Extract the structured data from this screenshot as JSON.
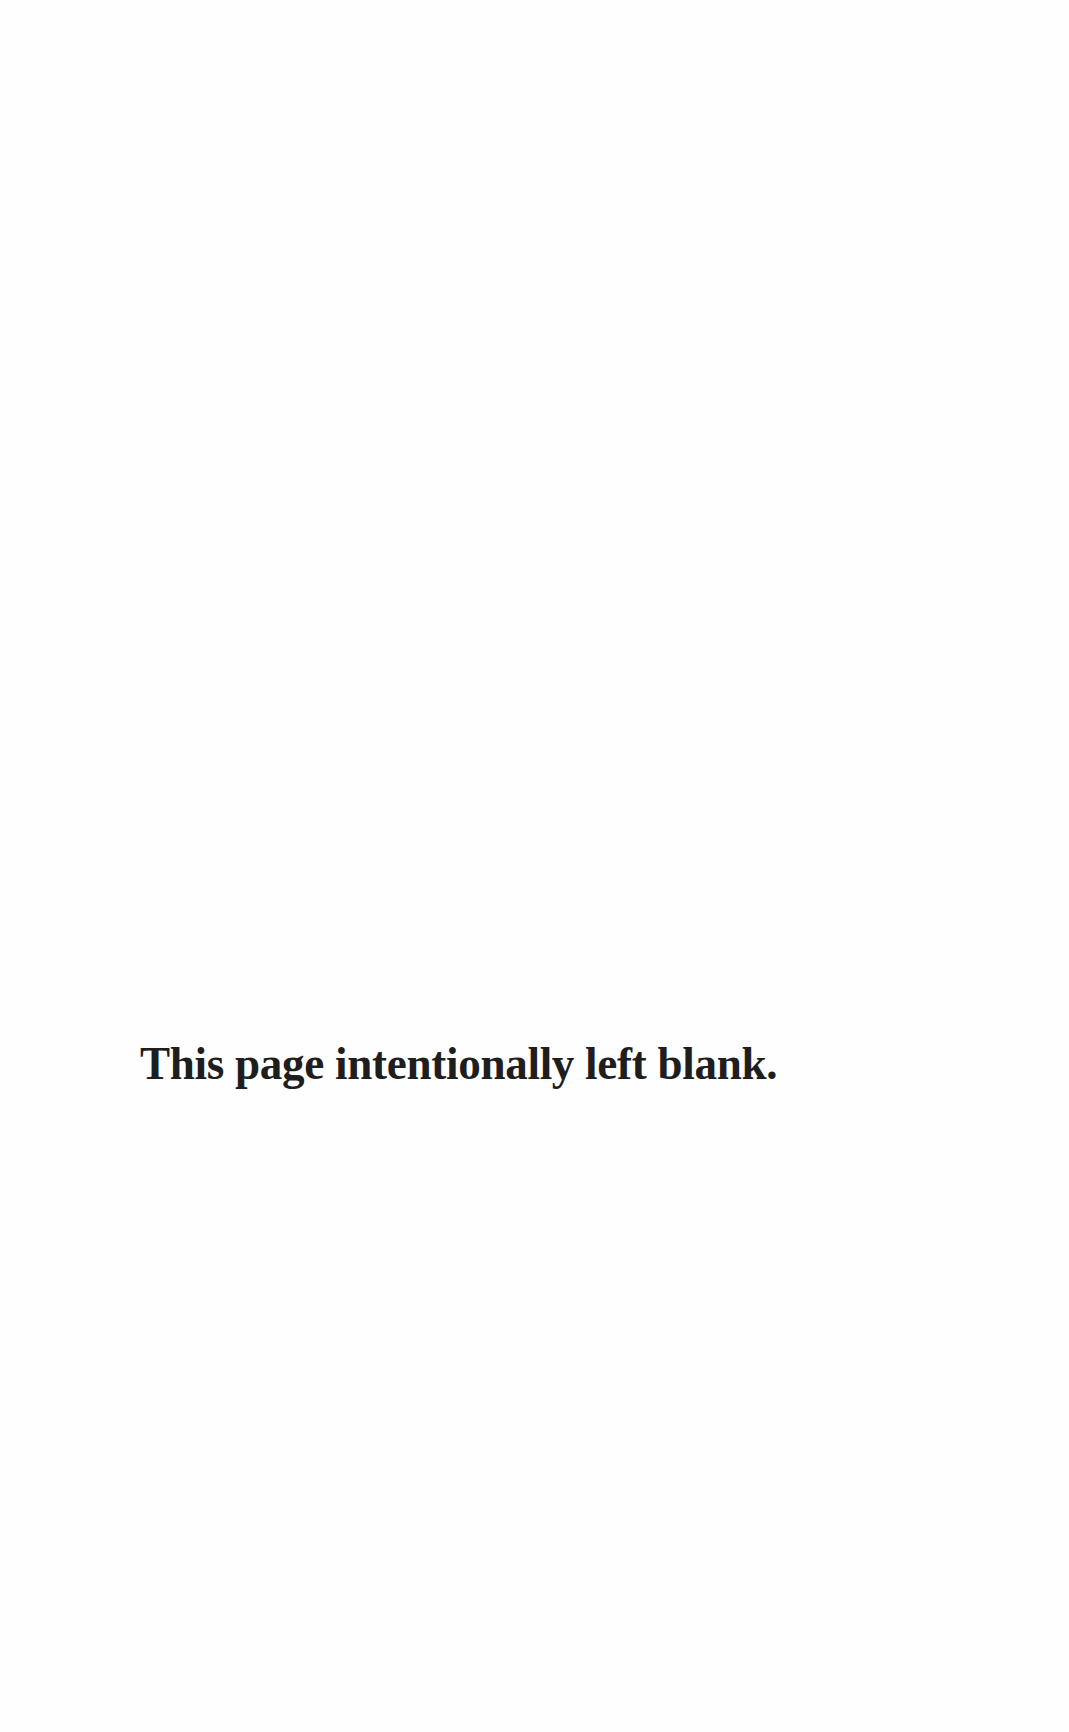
{
  "page": {
    "notice_text": "This page intentionally left blank.",
    "text_color": "#1e1e1e",
    "background_color": "#ffffff"
  }
}
